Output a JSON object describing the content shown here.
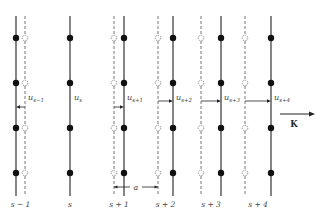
{
  "diagram": {
    "planes": [
      {
        "index_label": "s − 1",
        "solid_x": 16,
        "dashed_x": 25,
        "displacement_label": "u",
        "displacement_sub": "s−1",
        "direction": "left"
      },
      {
        "index_label": "s",
        "solid_x": 70,
        "dashed_x": null,
        "displacement_label": "u",
        "displacement_sub": "s",
        "direction": "none"
      },
      {
        "index_label": "s + 1",
        "solid_x": 124,
        "dashed_x": 114,
        "displacement_label": "u",
        "displacement_sub": "s+1",
        "direction": "right"
      },
      {
        "index_label": "s + 2",
        "solid_x": 173,
        "dashed_x": 158,
        "displacement_label": "u",
        "displacement_sub": "s+2",
        "direction": "right"
      },
      {
        "index_label": "s + 3",
        "solid_x": 221,
        "dashed_x": 201,
        "displacement_label": "u",
        "displacement_sub": "s+3",
        "direction": "right"
      },
      {
        "index_label": "s + 4",
        "solid_x": 271,
        "dashed_x": 245,
        "displacement_label": "u",
        "displacement_sub": "s+4",
        "direction": "right"
      }
    ],
    "atom_rows_y": [
      38,
      83,
      128,
      173
    ],
    "spacing_label": "a",
    "wavevector_label": "K",
    "colors": {
      "solid": "#333333",
      "dashed": "#777777",
      "atom": "#111111",
      "open_atom": "#ffffff"
    }
  }
}
